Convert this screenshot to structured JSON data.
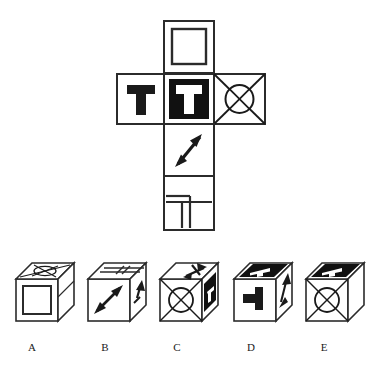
{
  "puzzle": {
    "type": "cube-net-folding",
    "title": "Cube net and answer options",
    "net": {
      "name": "unfolded-cube-net",
      "layout": "cross",
      "faces": [
        {
          "id": "top",
          "position": "row1-col2",
          "symbol": "square-outline",
          "description": "White square with inner square outline",
          "background": "#ffffff",
          "ink": "#1a1a1a"
        },
        {
          "id": "left",
          "position": "row2-col1",
          "symbol": "letter-T-black",
          "letter": "T",
          "description": "Black letter T on white background",
          "background": "#ffffff",
          "ink": "#1a1a1a"
        },
        {
          "id": "front",
          "position": "row2-col2",
          "symbol": "letter-T-white-on-black",
          "letter": "T",
          "description": "White letter T on black background",
          "background": "#1a1a1a",
          "ink": "#ffffff"
        },
        {
          "id": "right",
          "position": "row2-col3",
          "symbol": "circle-in-x",
          "description": "Square with both diagonals and a circle at center",
          "background": "#ffffff",
          "ink": "#1a1a1a"
        },
        {
          "id": "bottom",
          "position": "row3-col2",
          "symbol": "diagonal-double-arrow",
          "description": "Double-headed arrow pointing north-east and south-west",
          "background": "#ffffff",
          "ink": "#1a1a1a"
        },
        {
          "id": "back",
          "position": "row4-col2",
          "symbol": "partitioned-square",
          "description": "Square with horizontal and vertical lines forming lower-left partitions",
          "background": "#ffffff",
          "ink": "#1a1a1a"
        }
      ]
    },
    "options": [
      {
        "label": "A",
        "name": "option-a",
        "front_face": "square-outline",
        "top_face": "circle-in-x",
        "side_face": "blank",
        "description": "Cube showing square-in-square on front, circle-with-X on top, blank right side"
      },
      {
        "label": "B",
        "name": "option-b",
        "front_face": "diagonal-double-arrow",
        "top_face": "partitioned-square",
        "side_face": "arrow-fragment",
        "description": "Cube showing double arrow on front, partitioned square on top, arrow on right side"
      },
      {
        "label": "C",
        "name": "option-c",
        "front_face": "circle-in-x",
        "top_face": "diagonal-double-arrow",
        "side_face": "letter-T-white-on-black",
        "description": "Cube showing circle-with-X on front, double arrow on top, black panel with white T on right side"
      },
      {
        "label": "D",
        "name": "option-d",
        "front_face": "letter-T-rotated",
        "top_face": "letter-T-white-on-black",
        "side_face": "arrow-fragment",
        "description": "Cube showing rotated black T on front, black panel with white T on top, arrow on right side"
      },
      {
        "label": "E",
        "name": "option-e",
        "front_face": "circle-in-x",
        "top_face": "letter-T-white-on-black",
        "side_face": "blank",
        "description": "Cube showing circle-with-X on front, black panel with white T on top, blank right side"
      }
    ],
    "colors": {
      "ink": "#1a1a1a",
      "paper": "#ffffff",
      "stroke": "#2b2b2b"
    }
  }
}
